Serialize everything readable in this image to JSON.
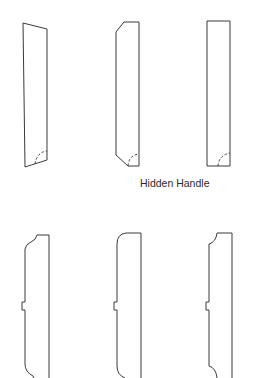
{
  "figure": {
    "caption": "Hidden Handle",
    "line_color": "#3a3a3a",
    "background": "#ffffff",
    "rows": [
      {
        "name": "hidden-handle-profiles",
        "panels": [
          {
            "id": "tapered-top-profile",
            "handle": "hidden",
            "handle_marker": "dashed-arc"
          },
          {
            "id": "chamfered-profile",
            "handle": "hidden",
            "handle_marker": "dashed-arc"
          },
          {
            "id": "square-profile",
            "handle": "hidden",
            "handle_marker": "dashed-arc"
          }
        ]
      },
      {
        "name": "edge-profiles-with-pull",
        "panels": [
          {
            "id": "ogee-edge-profile",
            "handle": "tab"
          },
          {
            "id": "rounded-edge-profile",
            "handle": "tab"
          },
          {
            "id": "cove-edge-profile",
            "handle": "tab"
          }
        ]
      }
    ]
  }
}
